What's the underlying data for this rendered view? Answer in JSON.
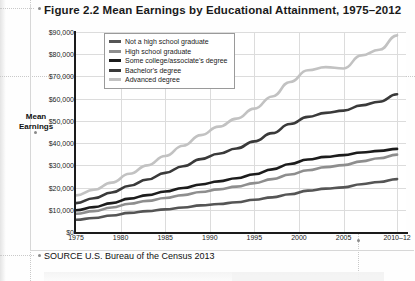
{
  "figure": {
    "title": "Figure 2.2  Mean Earnings by Educational Attainment, 1975–2012",
    "source": "SOURCE  U.S. Bureau of the Census 2013",
    "axis_title": "Mean\nEarnings",
    "axis_title_line1": "Mean",
    "axis_title_line2": "Earnings"
  },
  "chart_data": {
    "type": "line",
    "title": "Figure 2.2  Mean Earnings by Educational Attainment, 1975–2012",
    "subtitle": "",
    "xlabel": "",
    "ylabel": "Mean Earnings",
    "ylim": [
      0,
      90000
    ],
    "xlim": [
      1975,
      2012
    ],
    "grid": true,
    "legend_position": "top-left-inside",
    "y_ticks": [
      "$0",
      "$10,000",
      "$20,000",
      "$30,000",
      "$40,000",
      "$50,000",
      "$60,000",
      "$70,000",
      "$80,000",
      "$90,000"
    ],
    "y_tick_values": [
      0,
      10000,
      20000,
      30000,
      40000,
      50000,
      60000,
      70000,
      80000,
      90000
    ],
    "x_ticks": [
      "1975",
      "1980",
      "1985",
      "1990",
      "1995",
      "2000",
      "2005",
      "2010–12"
    ],
    "x_tick_values": [
      1975,
      1980,
      1985,
      1990,
      1995,
      2000,
      2005,
      2011
    ],
    "x": [
      1975,
      1977,
      1979,
      1981,
      1983,
      1985,
      1987,
      1989,
      1991,
      1993,
      1995,
      1997,
      1999,
      2001,
      2003,
      2005,
      2007,
      2009,
      2011
    ],
    "series": [
      {
        "name": "Not a high school graduate",
        "color": "#555555",
        "values": [
          5500,
          6300,
          7400,
          8600,
          9400,
          10200,
          11000,
          12000,
          12600,
          13400,
          14500,
          15600,
          17000,
          18600,
          19500,
          20100,
          21500,
          22500,
          23800
        ]
      },
      {
        "name": "High school graduate",
        "color": "#8e8e8e",
        "values": [
          8200,
          9400,
          11000,
          12700,
          14000,
          15300,
          16600,
          18000,
          19200,
          20400,
          22000,
          23800,
          25900,
          27800,
          29200,
          30100,
          31800,
          33200,
          34800
        ]
      },
      {
        "name": "Some college/associate's degree",
        "color": "#1c1c1c",
        "values": [
          9800,
          11200,
          13000,
          15000,
          16600,
          18200,
          19800,
          21400,
          22800,
          24200,
          26000,
          28200,
          30600,
          32600,
          33800,
          34600,
          35800,
          36500,
          37400
        ]
      },
      {
        "name": "Bachelor's degree",
        "color": "#3a3a3a",
        "values": [
          13000,
          15200,
          17800,
          20800,
          23600,
          26600,
          29600,
          32800,
          35200,
          37600,
          40800,
          44500,
          48600,
          51800,
          53600,
          54600,
          57000,
          58600,
          62000
        ]
      },
      {
        "name": "Advanced degree",
        "color": "#c2c2c2",
        "values": [
          16500,
          19000,
          22200,
          26200,
          30000,
          34200,
          38800,
          43600,
          47400,
          51000,
          55500,
          61000,
          67500,
          72800,
          74200,
          73600,
          79500,
          82000,
          88500
        ]
      }
    ]
  }
}
